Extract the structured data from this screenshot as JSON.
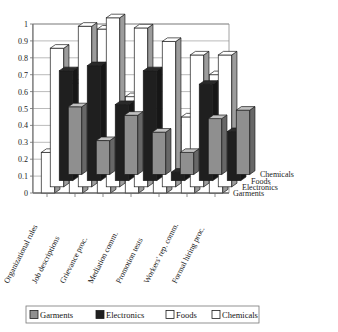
{
  "chart_data": {
    "type": "bar",
    "subtype": "3d-grouped-column",
    "title": "",
    "xlabel": "",
    "ylabel": "",
    "ylim": [
      0,
      1
    ],
    "ytick_step": 0.1,
    "yticks": [
      "1",
      "0.9",
      "0.8",
      "0.7",
      "0.6",
      "0.5",
      "0.4",
      "0.3",
      "0.2",
      "0.1",
      "0"
    ],
    "grid": true,
    "legend_position": "bottom",
    "categories": [
      "Organizational rules",
      "Job descriptions",
      "Grievance proc.",
      "Mediation comm.",
      "Promotion tests",
      "Workers' rep. comm.",
      "Formal hiring proc."
    ],
    "depth_axis_labels": [
      "Chemicals",
      "Foods",
      "Electronics",
      "Garments"
    ],
    "series": [
      {
        "name": "Garments",
        "color": "#8f8f8f",
        "values": [
          0.4,
          0.2,
          0.35,
          0.25,
          0.13,
          0.33,
          0.38
        ]
      },
      {
        "name": "Electronics",
        "color": "#1f1f1f",
        "values": [
          0.65,
          0.68,
          0.45,
          0.65,
          0.05,
          0.57,
          0.29
        ]
      },
      {
        "name": "Foods",
        "color": "#ffffff",
        "values": [
          0.82,
          0.95,
          1.0,
          0.94,
          0.86,
          0.78,
          0.78
        ]
      },
      {
        "name": "Chemicals",
        "color": "#ffffff",
        "values": [
          0.24,
          0.65,
          0.97,
          0.57,
          0.27,
          0.45,
          0.7
        ]
      }
    ]
  },
  "legend": {
    "items": [
      {
        "label": "Garments"
      },
      {
        "label": "Electronics"
      },
      {
        "label": "Foods"
      },
      {
        "label": "Chemicals"
      }
    ]
  }
}
